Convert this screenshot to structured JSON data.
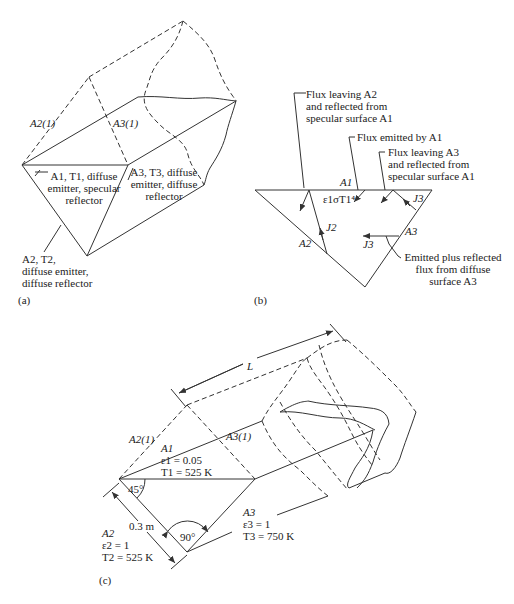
{
  "figure": {
    "panels": [
      {
        "id": "a",
        "tag": "(a)",
        "labels": {
          "a2_1": "A2(1)",
          "a3_1": "A3(1)",
          "a1": "A1, T1, diffuse emitter, specular reflector",
          "a1_line1": "A1, T1, diffuse",
          "a1_line2": "emitter, specular",
          "a1_line3": "reflector",
          "a3_line1": "A3, T3, diffuse",
          "a3_line2": "emitter, diffuse",
          "a3_line3": "reflector",
          "a2_line1": "A2, T2,",
          "a2_line2": "diffuse emitter,",
          "a2_line3": "diffuse reflector"
        }
      },
      {
        "id": "b",
        "tag": "(b)",
        "labels": {
          "flux_a2_line1": "Flux leaving A2",
          "flux_a2_line2": "and reflected from",
          "flux_a2_line3": "specular surface A1",
          "flux_emitted": "Flux emitted by A1",
          "flux_a3_line1": "Flux leaving A3",
          "flux_a3_line2": "and reflected from",
          "flux_a3_line3": "specular surface A1",
          "a1": "A1",
          "emission": "ε1σT1⁴",
          "j3_top": "J3",
          "j2": "J2",
          "a2": "A2",
          "a3": "A3",
          "j3_mid": "J3",
          "emitted_line1": "Emitted plus reflected",
          "emitted_line2": "flux from diffuse",
          "emitted_line3": "surface A3"
        }
      },
      {
        "id": "c",
        "tag": "(c)",
        "labels": {
          "length": "L",
          "a2_1": "A2(1)",
          "a3_1": "A3(1)",
          "a1_name": "A1",
          "a1_eps": "ε1 = 0.05",
          "a1_temp": "T1 = 525 K",
          "angle_45": "45°",
          "angle_90": "90°",
          "width": "0.3 m",
          "a2_name": "A2",
          "a2_eps": "ε2 = 1",
          "a2_temp": "T2 = 525 K",
          "a3_name": "A3",
          "a3_eps": "ε3 = 1",
          "a3_temp": "T3 = 750 K"
        }
      }
    ]
  }
}
